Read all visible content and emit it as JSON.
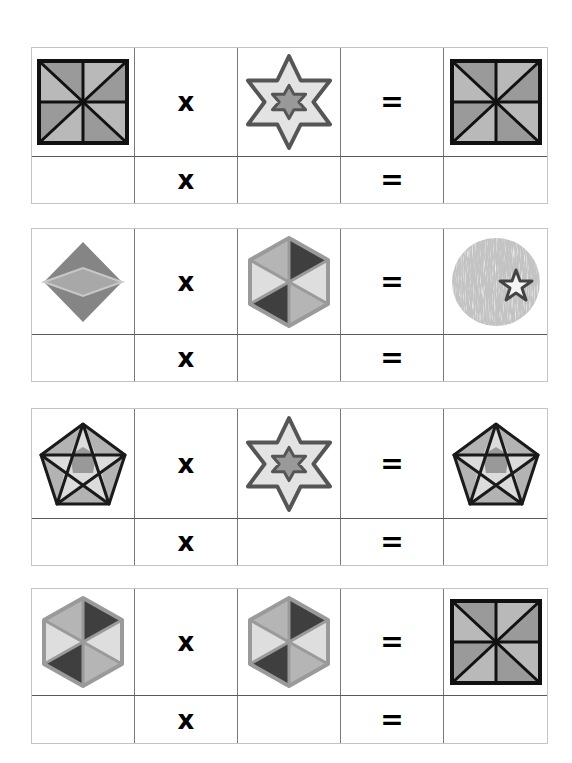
{
  "worksheet": {
    "puzzles": [
      {
        "top": 47,
        "top_h": 107,
        "bottom_h": 47,
        "operand1": "square-pinwheel",
        "operator": "x",
        "operand2": "six-point-star",
        "equals": "=",
        "result": "square-pinwheel",
        "answer_row": {
          "operator": "x",
          "equals": "=",
          "operand1": "",
          "operand2": "",
          "result": ""
        }
      },
      {
        "top": 228,
        "top_h": 104,
        "bottom_h": 47,
        "operand1": "diamond",
        "operator": "x",
        "operand2": "hexagon-pinwheel",
        "equals": "=",
        "result": "textured-circle-star",
        "answer_row": {
          "operator": "x",
          "equals": "=",
          "operand1": "",
          "operand2": "",
          "result": ""
        }
      },
      {
        "top": 408,
        "top_h": 108,
        "bottom_h": 47,
        "operand1": "pentagon-star",
        "operator": "x",
        "operand2": "six-point-star",
        "equals": "=",
        "result": "pentagon-star",
        "answer_row": {
          "operator": "x",
          "equals": "=",
          "operand1": "",
          "operand2": "",
          "result": ""
        }
      },
      {
        "top": 588,
        "top_h": 105,
        "bottom_h": 48,
        "operand1": "hexagon-pinwheel",
        "operator": "x",
        "operand2": "hexagon-pinwheel",
        "equals": "=",
        "result": "square-pinwheel",
        "answer_row": {
          "operator": "x",
          "equals": "=",
          "operand1": "",
          "operand2": "",
          "result": ""
        }
      }
    ]
  },
  "colors": {
    "shape_dark": "#8f8f8f",
    "shape_mid": "#a9a9a9",
    "shape_light": "#c4c4c4",
    "shape_lighter": "#dedede",
    "shape_darkest": "#3d3d3d",
    "outline": "#111111",
    "star_outline": "#555555"
  }
}
